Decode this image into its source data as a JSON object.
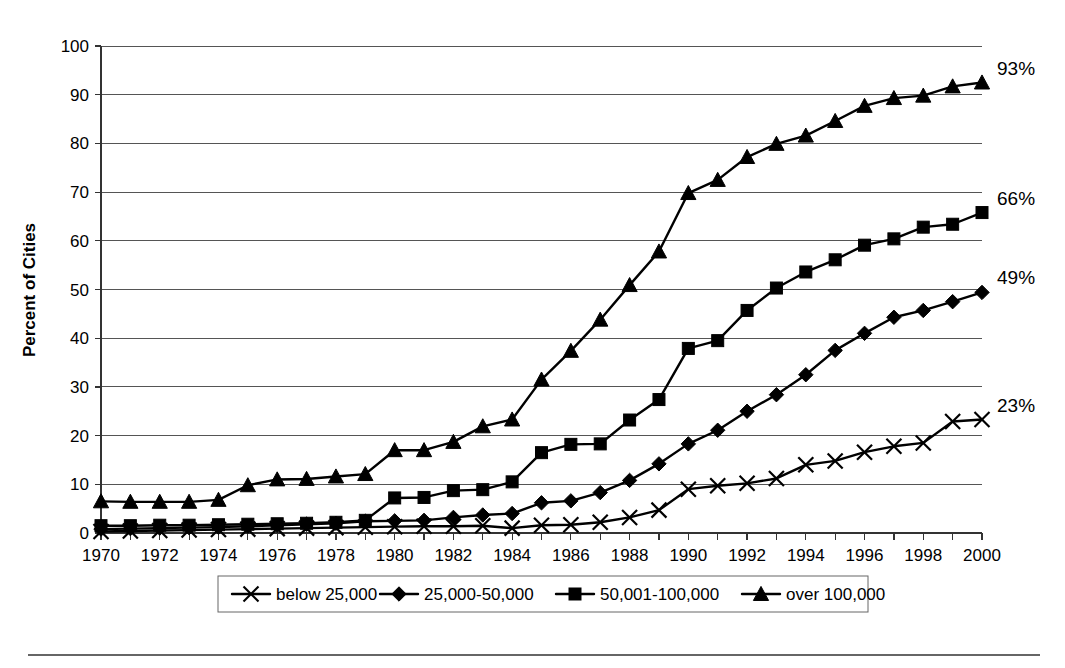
{
  "chart_data": {
    "type": "line",
    "title": "",
    "xlabel": "",
    "ylabel": "Percent of Cities",
    "xlim": [
      1970,
      2000
    ],
    "ylim": [
      0,
      100
    ],
    "grid": true,
    "legend_position": "bottom",
    "x": [
      1970,
      1971,
      1972,
      1973,
      1974,
      1975,
      1976,
      1977,
      1978,
      1979,
      1980,
      1981,
      1982,
      1983,
      1984,
      1985,
      1986,
      1987,
      1988,
      1989,
      1990,
      1991,
      1992,
      1993,
      1994,
      1995,
      1996,
      1997,
      1998,
      1999,
      2000
    ],
    "xtick_labels": [
      "1970",
      "1972",
      "1974",
      "1976",
      "1978",
      "1980",
      "1982",
      "1984",
      "1986",
      "1988",
      "1990",
      "1992",
      "1994",
      "1996",
      "1998",
      "2000"
    ],
    "ytick_labels": [
      "0",
      "10",
      "20",
      "30",
      "40",
      "50",
      "60",
      "70",
      "80",
      "90",
      "100"
    ],
    "ytick_values": [
      0,
      10,
      20,
      30,
      40,
      50,
      60,
      70,
      80,
      90,
      100
    ],
    "series": [
      {
        "name": "below 25,000",
        "marker": "x",
        "end_label": "23%",
        "values": [
          0.3,
          0.4,
          0.5,
          0.6,
          0.7,
          0.8,
          0.9,
          1.0,
          1.1,
          1.2,
          1.3,
          1.4,
          1.4,
          1.5,
          1.0,
          1.6,
          1.7,
          2.2,
          3.2,
          4.7,
          9.0,
          9.7,
          10.2,
          11.2,
          14.0,
          14.8,
          16.6,
          17.8,
          18.5,
          22.9,
          23.3
        ]
      },
      {
        "name": "25,000-50,000",
        "marker": "diamond",
        "end_label": "49%",
        "values": [
          0.8,
          0.9,
          1.0,
          1.1,
          1.2,
          1.4,
          1.6,
          1.8,
          2.0,
          2.4,
          2.5,
          2.6,
          3.2,
          3.7,
          4.0,
          6.2,
          6.6,
          8.3,
          10.8,
          14.2,
          18.3,
          21.1,
          25.0,
          28.4,
          32.5,
          37.5,
          41.0,
          44.3,
          45.7,
          47.5,
          49.4
        ]
      },
      {
        "name": "50,001-100,000",
        "marker": "square",
        "end_label": "66%",
        "values": [
          1.5,
          1.5,
          1.6,
          1.6,
          1.7,
          1.8,
          1.9,
          2.0,
          2.2,
          2.6,
          7.2,
          7.3,
          8.7,
          8.9,
          10.5,
          16.5,
          18.2,
          18.3,
          23.2,
          27.4,
          37.9,
          39.5,
          45.7,
          50.3,
          53.6,
          56.1,
          59.1,
          60.4,
          62.8,
          63.4,
          65.8
        ]
      },
      {
        "name": "over 100,000",
        "marker": "triangle",
        "end_label": "93%",
        "values": [
          6.5,
          6.4,
          6.4,
          6.4,
          6.8,
          9.8,
          11.0,
          11.1,
          11.6,
          12.1,
          17.0,
          17.0,
          18.7,
          21.9,
          23.3,
          31.5,
          37.4,
          43.8,
          50.9,
          57.8,
          69.8,
          72.5,
          77.2,
          79.9,
          81.6,
          84.6,
          87.7,
          89.3,
          89.8,
          91.7,
          92.5
        ]
      }
    ]
  }
}
